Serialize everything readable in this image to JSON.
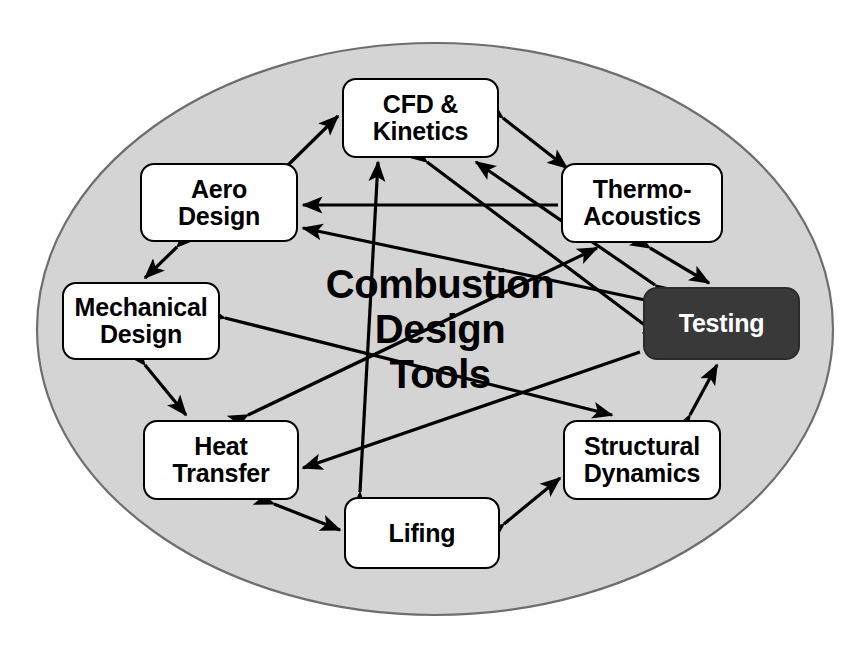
{
  "diagram": {
    "title": "Combustion Design Tools",
    "title_lines": "Combustion\nDesign\nTools",
    "background_shape": "ellipse",
    "ellipse": {
      "fill_color": "#d4d4d4",
      "stroke_color": "#6e6e6e",
      "cx": 435,
      "cy": 329,
      "rx": 398,
      "ry": 286
    },
    "colors": {
      "node_fill": "#ffffff",
      "node_stroke": "#000000",
      "node_text": "#000000",
      "highlight_fill": "#393939",
      "highlight_text": "#ffffff",
      "arrow_color": "#000000",
      "canvas": "#ffffff"
    },
    "nodes": [
      {
        "id": "cfd-kinetics",
        "label": "CFD &\nKinetics",
        "x": 342,
        "y": 78,
        "w": 157,
        "h": 80,
        "highlighted": false
      },
      {
        "id": "aero-design",
        "label": "Aero\nDesign",
        "x": 140,
        "y": 163,
        "w": 158,
        "h": 79,
        "highlighted": false
      },
      {
        "id": "thermo-acoustics",
        "label": "Thermo-\nAcoustics",
        "x": 561,
        "y": 163,
        "w": 162,
        "h": 80,
        "highlighted": false
      },
      {
        "id": "mechanical-design",
        "label": "Mechanical\nDesign",
        "x": 62,
        "y": 282,
        "w": 158,
        "h": 78,
        "highlighted": false
      },
      {
        "id": "testing",
        "label": "Testing",
        "x": 643,
        "y": 287,
        "w": 157,
        "h": 73,
        "highlighted": true
      },
      {
        "id": "heat-transfer",
        "label": "Heat\nTransfer",
        "x": 143,
        "y": 420,
        "w": 156,
        "h": 80,
        "highlighted": false
      },
      {
        "id": "structural-dynamics",
        "label": "Structural\nDynamics",
        "x": 563,
        "y": 420,
        "w": 158,
        "h": 80,
        "highlighted": false
      },
      {
        "id": "lifing",
        "label": "Lifing",
        "x": 344,
        "y": 497,
        "w": 156,
        "h": 72,
        "highlighted": false
      }
    ],
    "connections": [
      {
        "from": "aero-design",
        "to": "cfd-kinetics",
        "type": "double"
      },
      {
        "from": "cfd-kinetics",
        "to": "thermo-acoustics",
        "type": "double"
      },
      {
        "from": "aero-design",
        "to": "mechanical-design",
        "type": "double"
      },
      {
        "from": "mechanical-design",
        "to": "heat-transfer",
        "type": "double"
      },
      {
        "from": "heat-transfer",
        "to": "lifing",
        "type": "double"
      },
      {
        "from": "lifing",
        "to": "structural-dynamics",
        "type": "double"
      },
      {
        "from": "structural-dynamics",
        "to": "testing",
        "type": "double"
      },
      {
        "from": "thermo-acoustics",
        "to": "testing",
        "type": "double"
      },
      {
        "from": "thermo-acoustics",
        "to": "aero-design",
        "type": "single"
      },
      {
        "from": "testing",
        "to": "aero-design",
        "type": "single"
      },
      {
        "from": "testing",
        "to": "cfd-kinetics",
        "type": "double"
      },
      {
        "from": "testing",
        "to": "heat-transfer",
        "type": "single"
      },
      {
        "from": "lifing",
        "to": "cfd-kinetics",
        "type": "double"
      },
      {
        "from": "heat-transfer",
        "to": "thermo-acoustics",
        "type": "double"
      },
      {
        "from": "mechanical-design",
        "to": "structural-dynamics",
        "type": "double"
      },
      {
        "from": "cfd-kinetics",
        "to": "testing",
        "type": "double"
      }
    ]
  }
}
